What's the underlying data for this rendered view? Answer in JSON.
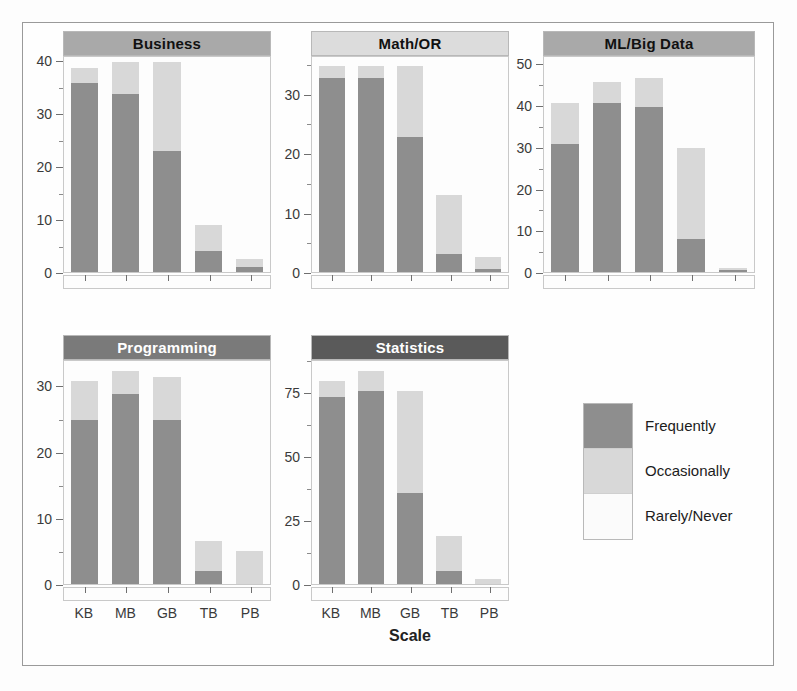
{
  "chart_data": {
    "type": "bar",
    "subtype": "stacked-bar-facet-grid",
    "title": "",
    "xlabel": "Scale",
    "ylabel": "",
    "categories": [
      "KB",
      "MB",
      "GB",
      "TB",
      "PB"
    ],
    "legend": {
      "position": "bottom-right",
      "entries": [
        {
          "label": "Frequently",
          "color": "#8e8e8e"
        },
        {
          "label": "Occasionally",
          "color": "#d8d8d8"
        },
        {
          "label": "Rarely/Never",
          "color": "#fbfbfb"
        }
      ]
    },
    "series_names": [
      "Frequently",
      "Occasionally",
      "Rarely/Never"
    ],
    "panels": [
      {
        "name": "Business",
        "strip_color": "#a9a9a9",
        "strip_text_color": "#111111",
        "ylim": [
          0,
          41
        ],
        "yticks": [
          0,
          10,
          20,
          30,
          40
        ],
        "ytick_labels": [
          "0",
          "10",
          "20",
          "30",
          "40"
        ],
        "yminor": [
          5,
          15,
          25,
          35
        ],
        "series": [
          {
            "name": "Frequently",
            "values": [
              36,
              34,
              23,
              4,
              1
            ]
          },
          {
            "name": "Occasionally",
            "values": [
              3,
              6,
              17,
              5,
              1.5
            ]
          }
        ]
      },
      {
        "name": "Math/OR",
        "strip_color": "#dcdcdc",
        "strip_text_color": "#111111",
        "ylim": [
          0,
          36.5
        ],
        "yticks": [
          0,
          10,
          20,
          30
        ],
        "ytick_labels": [
          "0",
          "10",
          "20",
          "30"
        ],
        "yminor": [
          5,
          15,
          25,
          35
        ],
        "series": [
          {
            "name": "Frequently",
            "values": [
              33,
              33,
              23,
              3,
              0.5
            ]
          },
          {
            "name": "Occasionally",
            "values": [
              2,
              2,
              12,
              10,
              2
            ]
          }
        ]
      },
      {
        "name": "ML/Big Data",
        "strip_color": "#a9a9a9",
        "strip_text_color": "#111111",
        "ylim": [
          0,
          52
        ],
        "yticks": [
          0,
          10,
          20,
          30,
          40,
          50
        ],
        "ytick_labels": [
          "0",
          "10",
          "20",
          "30",
          "40",
          "50"
        ],
        "yminor": [
          5,
          15,
          25,
          35,
          45
        ],
        "series": [
          {
            "name": "Frequently",
            "values": [
              31,
              41,
              40,
              8,
              0.5
            ]
          },
          {
            "name": "Occasionally",
            "values": [
              10,
              5,
              7,
              22,
              0.5
            ]
          }
        ]
      },
      {
        "name": "Programming",
        "strip_color": "#7a7a7a",
        "strip_text_color": "#ffffff",
        "ylim": [
          0,
          34
        ],
        "yticks": [
          0,
          10,
          20,
          30
        ],
        "ytick_labels": [
          "0",
          "10",
          "20",
          "30"
        ],
        "yminor": [
          5,
          15,
          25
        ],
        "series": [
          {
            "name": "Frequently",
            "values": [
              25,
              29,
              25,
              2,
              0
            ]
          },
          {
            "name": "Occasionally",
            "values": [
              6,
              3.5,
              6.5,
              4.5,
              5
            ]
          }
        ]
      },
      {
        "name": "Statistics",
        "strip_color": "#5a5a5a",
        "strip_text_color": "#ffffff",
        "ylim": [
          0,
          88
        ],
        "yticks": [
          0,
          25,
          50,
          75
        ],
        "ytick_labels": [
          "0",
          "25",
          "50",
          "75"
        ],
        "yminor": [
          12.5,
          37.5,
          62.5,
          87.5
        ],
        "series": [
          {
            "name": "Frequently",
            "values": [
              74,
              76,
              36,
              5,
              0
            ]
          },
          {
            "name": "Occasionally",
            "values": [
              6,
              8,
              40,
              14,
              2
            ]
          }
        ]
      }
    ]
  },
  "axis": {
    "xlabel": "Scale"
  }
}
